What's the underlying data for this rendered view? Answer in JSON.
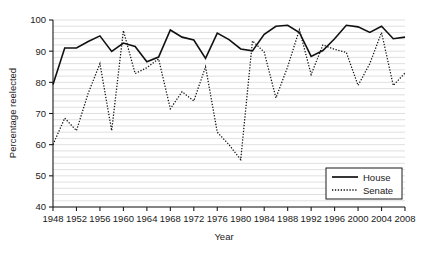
{
  "chart_data": {
    "type": "line",
    "title": "",
    "xlabel": "Year",
    "ylabel": "Percentage reelected",
    "xlim": [
      1948,
      2008
    ],
    "ylim": [
      40,
      100
    ],
    "xtick_step": 4,
    "ytick_step": 10,
    "grid": "horizontal-minor",
    "legend_position": "bottom-right",
    "x": [
      1948,
      1950,
      1952,
      1954,
      1956,
      1958,
      1960,
      1962,
      1964,
      1966,
      1968,
      1970,
      1972,
      1974,
      1976,
      1978,
      1980,
      1982,
      1984,
      1986,
      1988,
      1990,
      1992,
      1994,
      1996,
      1998,
      2000,
      2002,
      2004,
      2006,
      2008
    ],
    "xticks": [
      1948,
      1952,
      1956,
      1960,
      1964,
      1968,
      1972,
      1976,
      1980,
      1984,
      1988,
      1992,
      1996,
      2000,
      2004,
      2008
    ],
    "xtick_labels": [
      "1948",
      "1952",
      "1956",
      "1960",
      "1964",
      "1968",
      "1972",
      "1976",
      "1980",
      "1984",
      "1988",
      "1992",
      "1996",
      "2000",
      "2004",
      "2008"
    ],
    "yticks": [
      40,
      50,
      60,
      70,
      80,
      90,
      100
    ],
    "ytick_labels": [
      "40",
      "50",
      "60",
      "70",
      "80",
      "90",
      "100"
    ],
    "series": [
      {
        "name": "House",
        "style": "solid",
        "color": "#111111",
        "values": [
          79.3,
          91.0,
          91.0,
          93.1,
          94.9,
          89.9,
          92.6,
          91.5,
          86.6,
          88.1,
          96.8,
          94.5,
          93.6,
          87.7,
          95.8,
          93.7,
          90.7,
          90.1,
          95.4,
          98.0,
          98.3,
          96.0,
          88.3,
          90.2,
          94.0,
          98.3,
          97.8,
          96.0,
          98.0,
          94.0,
          94.5
        ]
      },
      {
        "name": "Senate",
        "style": "dotted",
        "color": "#111111",
        "values": [
          60.0,
          68.5,
          64.5,
          76.5,
          86.0,
          64.5,
          96.6,
          82.8,
          84.7,
          87.5,
          71.5,
          77.0,
          74.0,
          85.0,
          64.0,
          60.0,
          55.2,
          93.3,
          89.7,
          75.0,
          85.0,
          96.9,
          82.5,
          92.0,
          90.6,
          89.6,
          79.0,
          86.0,
          96.0,
          79.0,
          83.0
        ]
      }
    ]
  },
  "legend": {
    "entries": [
      {
        "label": "House",
        "style": "solid"
      },
      {
        "label": "Senate",
        "style": "dotted"
      }
    ]
  },
  "axes": {
    "x_title": "Year",
    "y_title": "Percentage reelected"
  }
}
